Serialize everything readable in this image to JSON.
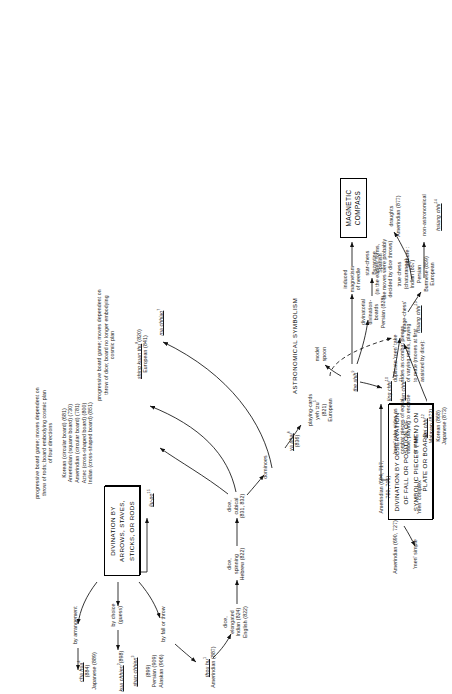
{
  "diagram": {
    "section_label": "ASTRONOMICAL SYMBOLISM",
    "boxes": {
      "arrows_box": "DIVINATION BY ARROWS,\nSTAVES, STICKS, OR RODS",
      "men_box": "DIVINATION BY OBSERVATION OF\nFALL OR POSITION OF SYMBOLIC\nPIECES ('MEN') ON PLATE OR BOARD",
      "compass_box": "MAGNETIC\nCOMPASS"
    },
    "nodes": [
      {
        "id": "by_arrangement",
        "text": "by arrangement"
      },
      {
        "id": "by_choice",
        "text": "by choice\n(guess)"
      },
      {
        "id": "by_fall",
        "text": "by fall or throw"
      },
      {
        "id": "cha_hua",
        "text": "cha hua",
        "sup": "4",
        "underline": true,
        "sub": "(884)\nJapanese (889)"
      },
      {
        "id": "kua_chhien",
        "text": "kua chhien",
        "sup": "2",
        "underline": true,
        "sub": "(898)"
      },
      {
        "id": "shan_chhien",
        "text": "shan chhien",
        "sup": "3",
        "underline": true,
        "sub": "(899)\nPersian (909)\nAlaskan (906)"
      },
      {
        "id": "thou_hu",
        "text": "thou hu",
        "sup": "1",
        "underline": true,
        "sub": "Amerindian (887)"
      },
      {
        "id": "dice_elongated",
        "text": "dice,\nelongated\nIndian (824)\nEnglish (822)"
      },
      {
        "id": "dice_spinning",
        "text": "dice,\nspinning\nHebrew (822)"
      },
      {
        "id": "dice_cubical",
        "text": "dice,\ncubical\n(831, 832)"
      },
      {
        "id": "dominoes",
        "text": "dominoes"
      },
      {
        "id": "ya_phai",
        "text": "ya phai",
        "sup": "6",
        "underline": true,
        "sub": "(836)"
      },
      {
        "id": "playing_cards",
        "text": "playing-cards\nyeh tzu",
        "sup": "5",
        "underline_part": "yeh tzu",
        "sub": "(821)\nEuropean"
      },
      {
        "id": "liu_po",
        "text": "liu-po",
        "sup": "15",
        "underline": true,
        "sub": "progressive board game; moves dependent on\nthrow of rods; board embodying cosmic plan\nof four directions\n\nKorean (circular board) (681)\nAmerindian (square board) (730)\nAmerindian (circular board) (781)\nAztec (cross-shaped board) (800)\nIndian (cross-shaped board) (851)"
      },
      {
        "id": "shing_kuan_thu",
        "text": "shing kuan thu",
        "sup": "8",
        "underline": true,
        "sub": "(820)\nEuropean (841)",
        "desc": "progressive board game; moves dependent on\nthrow of dice; board no longer embodying\ncosmic plan"
      },
      {
        "id": "ma_chhiao",
        "text": "ma chhiao",
        "sup": "7",
        "underline": true
      },
      {
        "id": "the_shih",
        "text": "the shih",
        "sup": "9",
        "underline": true
      },
      {
        "id": "model_spoon",
        "text": "model\nspoon"
      },
      {
        "id": "induced_mag",
        "text": "induced\nmagnetism\nof needle"
      },
      {
        "id": "divination_boards",
        "text": "divinatorial\ndivination-\nboards\nPersian (828)"
      },
      {
        "id": "star_chess",
        "text": "star-chess\nByzantine\nSpanish"
      },
      {
        "id": "non_astro",
        "text": "non-astronomical\nhsiang chhi",
        "sup": "14",
        "underline_part": "hsiang chhi"
      },
      {
        "id": "ling_chhi",
        "text": "ling chhi",
        "sup": "10",
        "underline": true
      },
      {
        "id": "tan_chhi",
        "text": "tan chhi",
        "sup": "11",
        "underline": true
      },
      {
        "id": "men_simple",
        "text": "'men' simple"
      },
      {
        "id": "men_complex",
        "text": "'men' complex"
      },
      {
        "id": "amer_690",
        "text": "Amerindian (690, 727)"
      },
      {
        "id": "amer_694",
        "text": "Amerindian (694, 717,\n750, 701)"
      },
      {
        "id": "equal_value",
        "text": "'men' take sides as\ncombat pieces of equal\nvalue, playing to encircle\nor mate:"
      },
      {
        "id": "wei_chhi",
        "text": "wei chhi",
        "sup": "12",
        "underline": true,
        "sub": "Malayan (872)\nKorean (868)\nJapanese (873)"
      },
      {
        "id": "duplicate",
        "text": "duplicate 'men' take\nsides as combat pieces\nof varying ranks, playing\nto mate (moves at first\nassisted by dice):"
      },
      {
        "id": "image_chess",
        "text": "'image-chess'\nhsiang chhi",
        "sup": "13",
        "underline_part": "hsiang chhi"
      },
      {
        "id": "true_chess",
        "text": "true chess\n(chaturanga)\nIndian (857)\nPersian\nBurmese (859)\nEuropean"
      },
      {
        "id": "earliest_forms",
        "text": "(in the earliest forms,\nthe moves were probably\ndecided by dice throws)"
      },
      {
        "id": "capture",
        "text": "capture :"
      },
      {
        "id": "draughts",
        "text": "draughts\nAmerindian (877)"
      }
    ]
  }
}
